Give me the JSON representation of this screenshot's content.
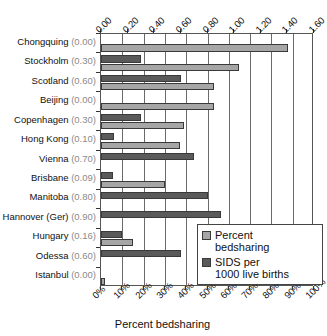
{
  "chart_data": {
    "type": "bar",
    "orientation": "horizontal",
    "title": "",
    "subtitle": "",
    "xlabel": "Percent bedsharing",
    "ylabel": "",
    "grid": true,
    "legend_position": "inside-bottom-right",
    "categories": [
      "Chongquing (0.00)",
      "Stockholm (0.30)",
      "Scotland (0.60)",
      "Beijing (0.00)",
      "Copenhagen (0.30)",
      "Hong Kong (0.10)",
      "Vienna (0.70)",
      "Brisbane (0.09)",
      "Manitoba (0.80)",
      "Hannover (Ger) (0.90)",
      "Hungary (0.16)",
      "Odessa (0.60)",
      "Istanbul (0.00)"
    ],
    "category_names": [
      "Chongquing",
      "Stockholm",
      "Scotland",
      "Beijing",
      "Copenhagen",
      "Hong Kong",
      "Vienna",
      "Brisbane",
      "Manitoba",
      "Hannover (Ger)",
      "Hungary",
      "Odessa",
      "Istanbul"
    ],
    "category_values": [
      "(0.00)",
      "(0.30)",
      "(0.60)",
      "(0.00)",
      "(0.30)",
      "(0.10)",
      "(0.70)",
      "(0.09)",
      "(0.80)",
      "(0.90)",
      "(0.16)",
      "(0.60)",
      "(0.00)"
    ],
    "series": [
      {
        "name": "Percent bedsharing",
        "legend_label": "Percent\nbedsharing",
        "color": "#a6a6a6",
        "axis": "bottom",
        "unit": "%",
        "values": [
          88,
          65,
          53,
          53,
          39,
          37,
          0,
          30,
          0,
          0,
          15,
          0,
          2
        ]
      },
      {
        "name": "SIDS per 1000 live births",
        "legend_label": "SIDS per\n1000 live births",
        "color": "#5a5a5a",
        "axis": "top",
        "unit": "per 1000",
        "values": [
          0.0,
          0.3,
          0.6,
          0.0,
          0.3,
          0.1,
          0.7,
          0.09,
          0.8,
          0.9,
          0.16,
          0.6,
          0.0
        ]
      }
    ],
    "top_axis": {
      "label": "",
      "ticks": [
        "0.00",
        "0.20",
        "0.40",
        "0.60",
        "0.80",
        "1.00",
        "1.20",
        "1.40",
        "1.60"
      ],
      "min": 0.0,
      "max": 1.6,
      "step": 0.2
    },
    "bottom_axis": {
      "label": "Percent bedsharing",
      "ticks": [
        "0%",
        "10%",
        "20%",
        "30%",
        "40%",
        "50%",
        "60%",
        "70%",
        "80%",
        "90%",
        "100%"
      ],
      "min": 0,
      "max": 100,
      "step": 10
    }
  },
  "legend": {
    "items": [
      {
        "label": "Percent\nbedsharing",
        "color": "#a6a6a6"
      },
      {
        "label": "SIDS per\n1000 live births",
        "color": "#5a5a5a"
      }
    ]
  },
  "axis_title_bottom": "Percent bedsharing",
  "colors": {
    "bedsharing": "#a6a6a6",
    "sids": "#5a5a5a",
    "grid": "#6a6a6a",
    "frame": "#555555",
    "text": "#111111",
    "muted_text": "#8a8a8a",
    "background": "#ffffff"
  }
}
